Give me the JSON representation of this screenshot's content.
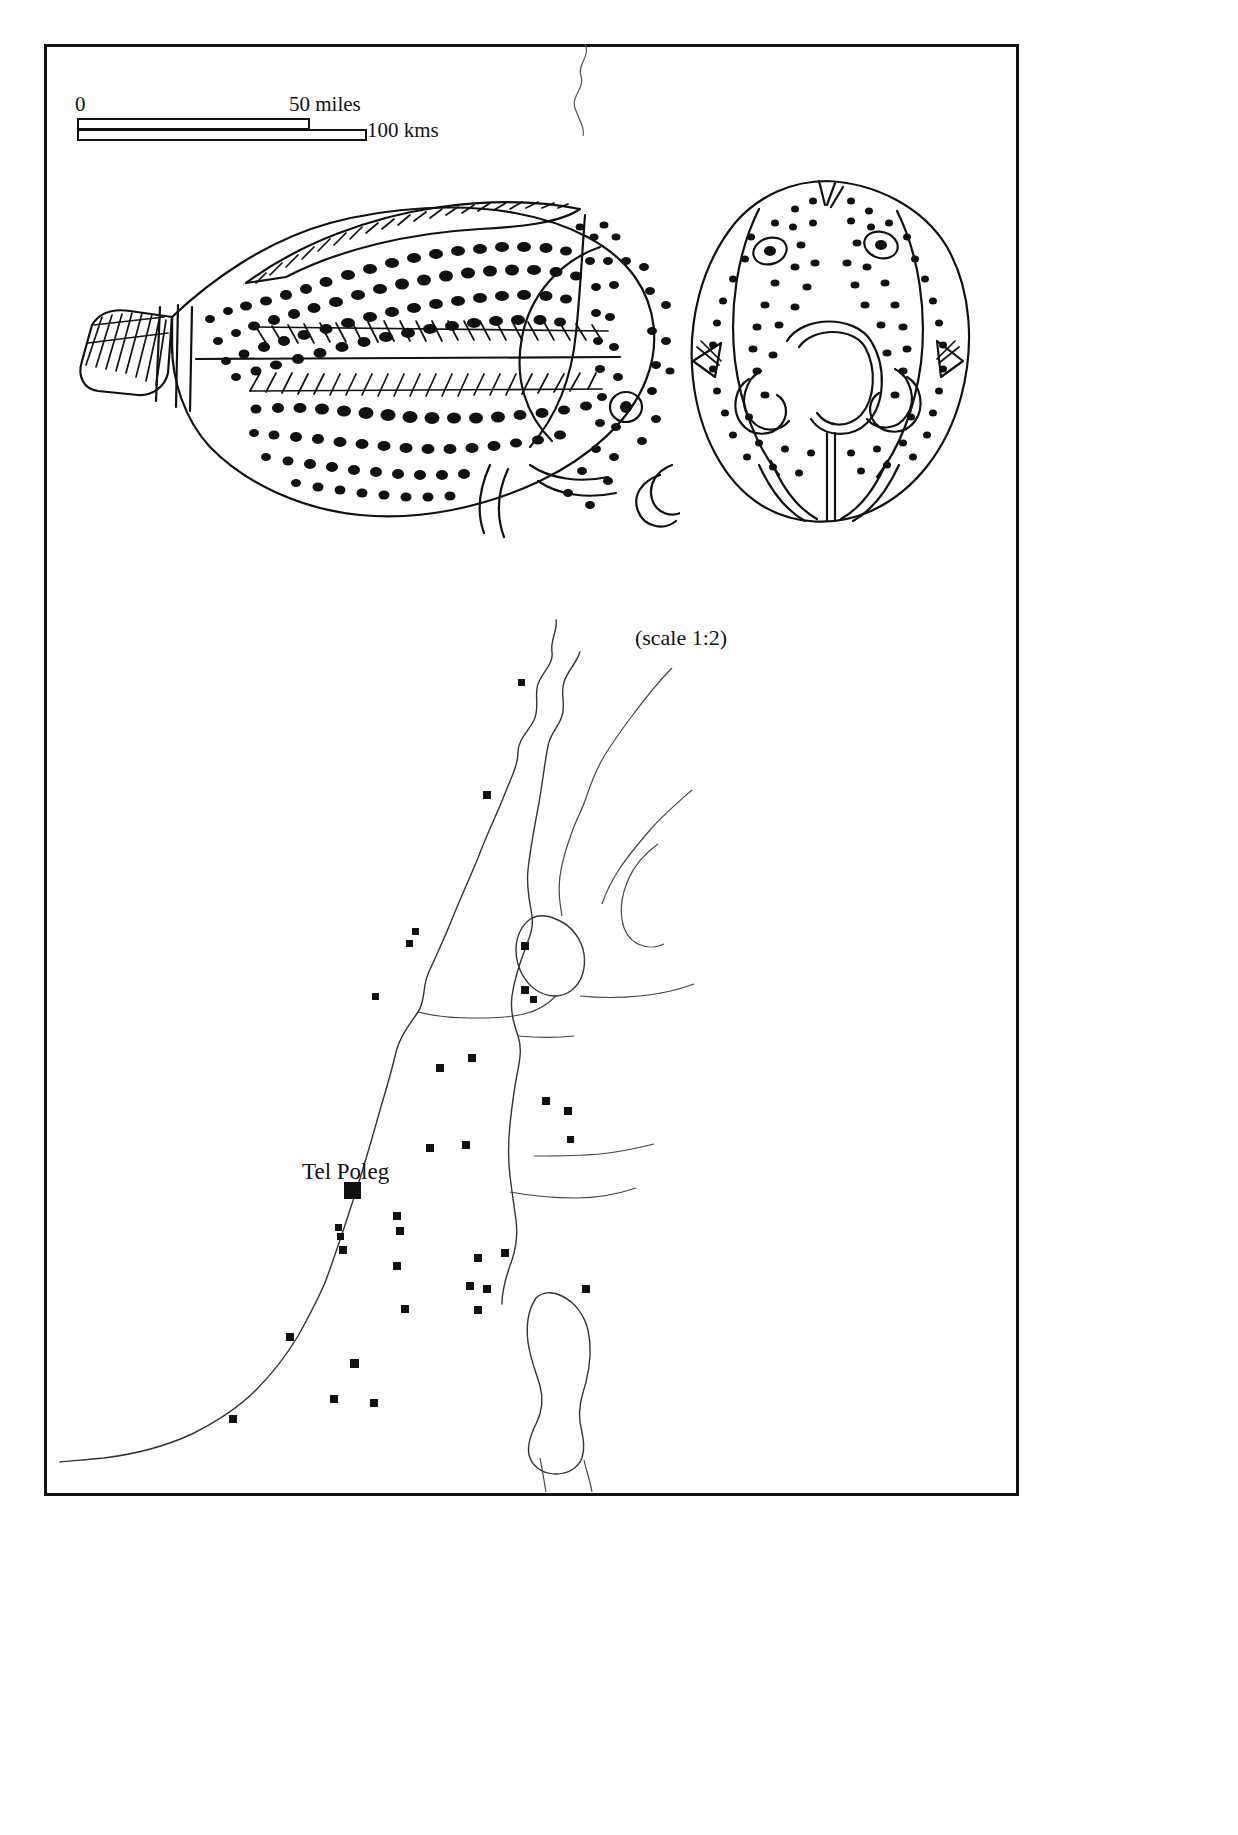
{
  "figure": {
    "type": "archaeological-plate",
    "background_color": "#ffffff",
    "ink_color": "#111111",
    "frame": {
      "border_width_px": 3,
      "color": "#111111"
    }
  },
  "scalebar": {
    "name": "distance-scale-bar",
    "zero_label": "0",
    "miles_label": "50 miles",
    "kms_label": "100 kms",
    "miles_value": 50,
    "kms_value": 100
  },
  "fish_figures": {
    "caption": "(scale 1:2)",
    "items": [
      {
        "name": "fish-lateral-view",
        "view": "lateral",
        "description": "Spotted fish drawing, lateral view with hatched dorsal fin, herringbone mid-line, spotted body, single round eye and tail at left"
      },
      {
        "name": "fish-dorsal-view",
        "view": "dorsal",
        "description": "Spotted fish drawing, dorsal/frontal view with two eyes and paired mouth / barbel outlines"
      }
    ]
  },
  "map": {
    "name": "site-distribution-map",
    "region_description": "Southern Levant coastline with inland valley and Dead Sea",
    "labels": [
      {
        "text": "Tel Poleg",
        "kind": "site-label",
        "x": 352,
        "y": 1190
      }
    ],
    "legend_note": "Filled squares mark archaeological sites; the large filled square marks Tel Poleg",
    "site_count": 34,
    "sites": [
      {
        "x": 521,
        "y": 682,
        "size": 7
      },
      {
        "x": 487,
        "y": 795,
        "size": 8
      },
      {
        "x": 415,
        "y": 931,
        "size": 7
      },
      {
        "x": 409,
        "y": 943,
        "size": 7
      },
      {
        "x": 525,
        "y": 946,
        "size": 8
      },
      {
        "x": 375,
        "y": 996,
        "size": 7
      },
      {
        "x": 525,
        "y": 990,
        "size": 8
      },
      {
        "x": 533,
        "y": 999,
        "size": 7
      },
      {
        "x": 440,
        "y": 1068,
        "size": 8
      },
      {
        "x": 472,
        "y": 1058,
        "size": 8
      },
      {
        "x": 546,
        "y": 1101,
        "size": 8
      },
      {
        "x": 568,
        "y": 1111,
        "size": 8
      },
      {
        "x": 570,
        "y": 1139,
        "size": 7
      },
      {
        "x": 430,
        "y": 1148,
        "size": 8
      },
      {
        "x": 466,
        "y": 1145,
        "size": 8
      },
      {
        "x": 352,
        "y": 1190,
        "size": 17,
        "main": true
      },
      {
        "x": 397,
        "y": 1216,
        "size": 8
      },
      {
        "x": 400,
        "y": 1231,
        "size": 8
      },
      {
        "x": 338,
        "y": 1227,
        "size": 7
      },
      {
        "x": 340,
        "y": 1236,
        "size": 7
      },
      {
        "x": 343,
        "y": 1250,
        "size": 8
      },
      {
        "x": 397,
        "y": 1266,
        "size": 8
      },
      {
        "x": 478,
        "y": 1258,
        "size": 8
      },
      {
        "x": 505,
        "y": 1253,
        "size": 8
      },
      {
        "x": 470,
        "y": 1286,
        "size": 8
      },
      {
        "x": 487,
        "y": 1289,
        "size": 8
      },
      {
        "x": 586,
        "y": 1289,
        "size": 8
      },
      {
        "x": 478,
        "y": 1310,
        "size": 8
      },
      {
        "x": 405,
        "y": 1309,
        "size": 8
      },
      {
        "x": 290,
        "y": 1337,
        "size": 8
      },
      {
        "x": 354,
        "y": 1363,
        "size": 9
      },
      {
        "x": 334,
        "y": 1399,
        "size": 8
      },
      {
        "x": 374,
        "y": 1403,
        "size": 8
      },
      {
        "x": 233,
        "y": 1419,
        "size": 8
      }
    ]
  }
}
